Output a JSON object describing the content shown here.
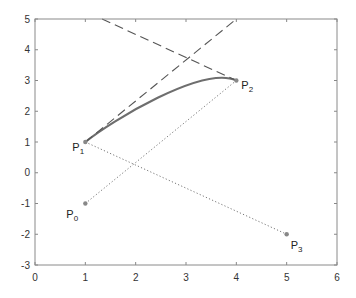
{
  "chart_data": {
    "type": "line",
    "title": "",
    "xlabel": "",
    "ylabel": "",
    "xlim": [
      0,
      6
    ],
    "ylim": [
      -3,
      5
    ],
    "grid": false,
    "legend": null,
    "x_ticks": [
      "0",
      "1",
      "2",
      "3",
      "4",
      "5",
      "6"
    ],
    "y_ticks": [
      "5",
      "4",
      "3",
      "2",
      "1",
      "0",
      "-1",
      "-2",
      "-3"
    ],
    "control_points": [
      {
        "name": "P",
        "sub": "0",
        "x": 1,
        "y": -1
      },
      {
        "name": "P",
        "sub": "1",
        "x": 1,
        "y": 1
      },
      {
        "name": "P",
        "sub": "2",
        "x": 4,
        "y": 3
      },
      {
        "name": "P",
        "sub": "3",
        "x": 5,
        "y": -2
      }
    ],
    "series": [
      {
        "name": "curve segment P1-P2",
        "style": "solid-thick",
        "color": "#6e6e6e",
        "bezier": [
          [
            1,
            1
          ],
          [
            1.5,
            1.667
          ],
          [
            3.333,
            3.5
          ],
          [
            4,
            3
          ]
        ]
      },
      {
        "name": "chord P0-P2",
        "style": "dotted",
        "color": "#777777",
        "x": [
          1,
          4
        ],
        "y": [
          -1,
          3
        ]
      },
      {
        "name": "chord P1-P3",
        "style": "dotted",
        "color": "#777777",
        "x": [
          1,
          5
        ],
        "y": [
          1,
          -2
        ]
      },
      {
        "name": "tangent at P1",
        "style": "dashed",
        "color": "#555555",
        "x": [
          1,
          4
        ],
        "y": [
          1,
          5
        ]
      },
      {
        "name": "tangent at P2",
        "style": "dashed",
        "color": "#555555",
        "x": [
          1.333,
          4
        ],
        "y": [
          5,
          3
        ]
      }
    ],
    "colors": {
      "axis": "#888888",
      "curve": "#6e6e6e",
      "point": "#888888",
      "dashed": "#555555",
      "dotted": "#777777"
    }
  }
}
